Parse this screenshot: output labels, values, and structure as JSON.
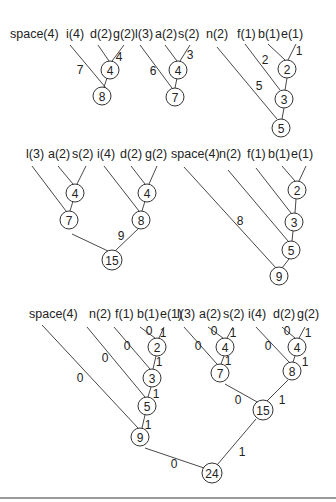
{
  "colors": {
    "line": "#333333",
    "text": "#222222",
    "background": "#ffffff",
    "rule": "#9a9a9a"
  },
  "panels": [
    {
      "id": "step1",
      "leaves": [
        {
          "label": "space(4)",
          "x": 10,
          "y": 38
        },
        {
          "label": "i(4)",
          "x": 66,
          "y": 38
        },
        {
          "label": "d(2)",
          "x": 90,
          "y": 38
        },
        {
          "label": "g(2)",
          "x": 113,
          "y": 38
        }
      ],
      "nodes": [
        {
          "value": "4",
          "x": 110,
          "y": 70
        },
        {
          "value": "8",
          "x": 102,
          "y": 96
        }
      ],
      "edges": [
        [
          98,
          45,
          109,
          61
        ],
        [
          124,
          45,
          112,
          61
        ],
        [
          70,
          45,
          106,
          88
        ],
        [
          107,
          78,
          104,
          87
        ]
      ],
      "edge_labels": [
        {
          "text": "4",
          "x": 119,
          "y": 57
        },
        {
          "text": "7",
          "x": 80,
          "y": 70
        }
      ]
    },
    {
      "id": "step2",
      "leaves": [
        {
          "label": "l(3)",
          "x": 135,
          "y": 38
        },
        {
          "label": "a(2)",
          "x": 155,
          "y": 38
        },
        {
          "label": "s(2)",
          "x": 178,
          "y": 38
        }
      ],
      "nodes": [
        {
          "value": "4",
          "x": 178,
          "y": 70
        },
        {
          "value": "7",
          "x": 175,
          "y": 97
        }
      ],
      "edges": [
        [
          165,
          45,
          177,
          61
        ],
        [
          190,
          45,
          180,
          61
        ],
        [
          140,
          45,
          172,
          88
        ],
        [
          177,
          78,
          175,
          88
        ]
      ],
      "edge_labels": [
        {
          "text": "3",
          "x": 190,
          "y": 55
        },
        {
          "text": "6",
          "x": 153,
          "y": 71
        }
      ]
    },
    {
      "id": "step3",
      "leaves": [
        {
          "label": "n(2)",
          "x": 206,
          "y": 38
        },
        {
          "label": "f(1)",
          "x": 237,
          "y": 38
        },
        {
          "label": "b(1)",
          "x": 258,
          "y": 38
        },
        {
          "label": "e(1)",
          "x": 281,
          "y": 38
        }
      ],
      "nodes": [
        {
          "value": "2",
          "x": 287,
          "y": 69
        },
        {
          "value": "3",
          "x": 284,
          "y": 99
        },
        {
          "value": "5",
          "x": 281,
          "y": 128
        }
      ],
      "edges": [
        [
          268,
          44,
          285,
          60
        ],
        [
          296,
          44,
          288,
          60
        ],
        [
          245,
          44,
          280,
          90
        ],
        [
          287,
          78,
          285,
          90
        ],
        [
          217,
          47,
          277,
          119
        ],
        [
          284,
          108,
          282,
          119
        ]
      ],
      "edge_labels": [
        {
          "text": "1",
          "x": 299,
          "y": 51
        },
        {
          "text": "2",
          "x": 265,
          "y": 60
        },
        {
          "text": "5",
          "x": 259,
          "y": 86
        }
      ]
    },
    {
      "id": "step4",
      "leaves": [
        {
          "label": "l(3)",
          "x": 26,
          "y": 158
        },
        {
          "label": "a(2)",
          "x": 48,
          "y": 158
        },
        {
          "label": "s(2)",
          "x": 72,
          "y": 158
        },
        {
          "label": "i(4)",
          "x": 97,
          "y": 158
        },
        {
          "label": "d(2)",
          "x": 120,
          "y": 158
        },
        {
          "label": "g(2)",
          "x": 145,
          "y": 158
        }
      ],
      "nodes": [
        {
          "value": "4",
          "x": 75,
          "y": 193
        },
        {
          "value": "7",
          "x": 69,
          "y": 220
        },
        {
          "value": "4",
          "x": 147,
          "y": 193
        },
        {
          "value": "8",
          "x": 141,
          "y": 220
        },
        {
          "value": "15",
          "x": 112,
          "y": 260
        }
      ],
      "edges": [
        [
          58,
          166,
          73,
          184
        ],
        [
          86,
          166,
          77,
          184
        ],
        [
          32,
          166,
          66,
          211
        ],
        [
          73,
          201,
          70,
          211
        ],
        [
          131,
          166,
          145,
          184
        ],
        [
          157,
          166,
          149,
          184
        ],
        [
          104,
          166,
          139,
          211
        ],
        [
          145,
          201,
          142,
          211
        ],
        [
          72,
          234,
          108,
          251
        ],
        [
          138,
          229,
          115,
          251
        ]
      ],
      "edge_labels": [
        {
          "text": "9",
          "x": 121,
          "y": 236
        }
      ]
    },
    {
      "id": "step5",
      "leaves": [
        {
          "label": "space(4)",
          "x": 171,
          "y": 158
        },
        {
          "label": "n(2)",
          "x": 219,
          "y": 158
        },
        {
          "label": "f(1)",
          "x": 247,
          "y": 158
        },
        {
          "label": "b(1)",
          "x": 268,
          "y": 158
        },
        {
          "label": "e(1)",
          "x": 291,
          "y": 158
        }
      ],
      "nodes": [
        {
          "value": "2",
          "x": 297,
          "y": 190
        },
        {
          "value": "3",
          "x": 294,
          "y": 222
        },
        {
          "value": "5",
          "x": 291,
          "y": 250
        },
        {
          "value": "9",
          "x": 279,
          "y": 276
        }
      ],
      "edges": [
        [
          282,
          166,
          295,
          181
        ],
        [
          306,
          166,
          299,
          181
        ],
        [
          256,
          168,
          291,
          213
        ],
        [
          296,
          199,
          295,
          213
        ],
        [
          228,
          170,
          288,
          241
        ],
        [
          293,
          231,
          292,
          241
        ],
        [
          184,
          167,
          276,
          268
        ],
        [
          289,
          259,
          282,
          268
        ]
      ],
      "edge_labels": [
        {
          "text": "8",
          "x": 240,
          "y": 221
        }
      ]
    },
    {
      "id": "final",
      "leaves": [
        {
          "label": "space(4)",
          "x": 29,
          "y": 318
        },
        {
          "label": "n(2)",
          "x": 89,
          "y": 318
        },
        {
          "label": "f(1)",
          "x": 115,
          "y": 318
        },
        {
          "label": "b(1)",
          "x": 137,
          "y": 318
        },
        {
          "label": "e(1)",
          "x": 160,
          "y": 318
        },
        {
          "label": "l(3)",
          "x": 177,
          "y": 318
        },
        {
          "label": "a(2)",
          "x": 199,
          "y": 318
        },
        {
          "label": "s(2)",
          "x": 223,
          "y": 318
        },
        {
          "label": "i(4)",
          "x": 248,
          "y": 318
        },
        {
          "label": "d(2)",
          "x": 273,
          "y": 318
        },
        {
          "label": "g(2)",
          "x": 297,
          "y": 318
        }
      ],
      "nodes": [
        {
          "value": "2",
          "x": 157,
          "y": 347
        },
        {
          "value": "3",
          "x": 152,
          "y": 378
        },
        {
          "value": "5",
          "x": 147,
          "y": 406
        },
        {
          "value": "9",
          "x": 140,
          "y": 437
        },
        {
          "value": "4",
          "x": 225,
          "y": 347
        },
        {
          "value": "7",
          "x": 220,
          "y": 373
        },
        {
          "value": "4",
          "x": 297,
          "y": 347
        },
        {
          "value": "8",
          "x": 292,
          "y": 371
        },
        {
          "value": "15",
          "x": 263,
          "y": 410
        },
        {
          "value": "24",
          "x": 212,
          "y": 473
        }
      ],
      "edges": [
        [
          140,
          327,
          155,
          338
        ],
        [
          164,
          327,
          159,
          338
        ],
        [
          114,
          327,
          150,
          369
        ],
        [
          156,
          356,
          153,
          369
        ],
        [
          87,
          327,
          145,
          397
        ],
        [
          151,
          387,
          148,
          397
        ],
        [
          42,
          325,
          138,
          428
        ],
        [
          145,
          415,
          142,
          428
        ],
        [
          208,
          327,
          223,
          338
        ],
        [
          233,
          327,
          227,
          338
        ],
        [
          184,
          327,
          217,
          364
        ],
        [
          224,
          356,
          221,
          364
        ],
        [
          282,
          327,
          295,
          338
        ],
        [
          305,
          327,
          299,
          338
        ],
        [
          256,
          327,
          289,
          362
        ],
        [
          295,
          356,
          293,
          362
        ],
        [
          225,
          384,
          259,
          403
        ],
        [
          288,
          380,
          267,
          401
        ],
        [
          145,
          448,
          204,
          468
        ],
        [
          256,
          419,
          217,
          465
        ]
      ],
      "edge_labels": [
        {
          "text": "0",
          "x": 149,
          "y": 331
        },
        {
          "text": "1",
          "x": 163,
          "y": 333
        },
        {
          "text": "0",
          "x": 127,
          "y": 346
        },
        {
          "text": "1",
          "x": 159,
          "y": 362
        },
        {
          "text": "0",
          "x": 105,
          "y": 358
        },
        {
          "text": "1",
          "x": 156,
          "y": 394
        },
        {
          "text": "0",
          "x": 80,
          "y": 378
        },
        {
          "text": "1",
          "x": 148,
          "y": 425
        },
        {
          "text": "0",
          "x": 214,
          "y": 331
        },
        {
          "text": "1",
          "x": 233,
          "y": 333
        },
        {
          "text": "0",
          "x": 198,
          "y": 346
        },
        {
          "text": "1",
          "x": 228,
          "y": 361
        },
        {
          "text": "0",
          "x": 287,
          "y": 331
        },
        {
          "text": "1",
          "x": 308,
          "y": 333
        },
        {
          "text": "0",
          "x": 268,
          "y": 346
        },
        {
          "text": "1",
          "x": 305,
          "y": 362
        },
        {
          "text": "0",
          "x": 238,
          "y": 400
        },
        {
          "text": "1",
          "x": 282,
          "y": 400
        },
        {
          "text": "0",
          "x": 174,
          "y": 464
        },
        {
          "text": "1",
          "x": 242,
          "y": 452
        }
      ]
    }
  ]
}
